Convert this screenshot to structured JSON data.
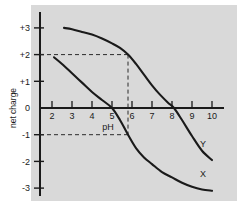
{
  "figure": {
    "background_color": "#ffffff",
    "panel_color": "#d9d9d9",
    "ink_color": "#1a1a1a"
  },
  "chart_data": {
    "type": "line",
    "title": "",
    "xlabel": "pH",
    "ylabel": "net charge",
    "xlim": [
      1.4,
      10.6
    ],
    "ylim": [
      -3.45,
      3.45
    ],
    "xticks": [
      2,
      3,
      4,
      5,
      6,
      7,
      8,
      9,
      10
    ],
    "xtick_labels": [
      "2",
      "3",
      "4",
      "5",
      "6",
      "7",
      "8",
      "9",
      "10"
    ],
    "yticks": [
      3,
      2,
      1,
      0,
      -1,
      -2,
      -3
    ],
    "ytick_labels": [
      "+3",
      "+2",
      "+1",
      "0",
      "-1",
      "-2",
      "-3"
    ],
    "grid": false,
    "legend": "inline-curve-labels",
    "series": [
      {
        "name": "Y",
        "label": "Y",
        "label_position": {
          "x": 9.55,
          "y": -1.45
        },
        "color": "#1a1a1a",
        "x": [
          2.6,
          3.0,
          3.5,
          4.0,
          4.5,
          5.0,
          5.4,
          5.8,
          6.2,
          6.6,
          7.0,
          7.4,
          7.8,
          8.1,
          8.5,
          9.0,
          9.5,
          10.0
        ],
        "y": [
          3.0,
          2.95,
          2.85,
          2.75,
          2.6,
          2.42,
          2.25,
          2.0,
          1.65,
          1.25,
          0.85,
          0.5,
          0.2,
          0.0,
          -0.45,
          -1.05,
          -1.6,
          -1.95
        ]
      },
      {
        "name": "X",
        "label": "X",
        "label_position": {
          "x": 9.55,
          "y": -2.6
        },
        "color": "#1a1a1a",
        "x": [
          2.1,
          2.5,
          3.0,
          3.5,
          4.0,
          4.5,
          5.0,
          5.4,
          5.8,
          6.2,
          6.6,
          7.0,
          7.5,
          8.0,
          8.5,
          9.0,
          9.5,
          10.0
        ],
        "y": [
          1.9,
          1.65,
          1.3,
          0.95,
          0.6,
          0.3,
          0.0,
          -0.45,
          -1.0,
          -1.5,
          -1.85,
          -2.1,
          -2.4,
          -2.6,
          -2.8,
          -2.95,
          -3.05,
          -3.1
        ]
      }
    ],
    "annotations": [
      {
        "name": "guide-horizontal-plus2",
        "type": "dashed-horizontal",
        "y": 2.0,
        "x_from": 1.4,
        "x_to": 5.8
      },
      {
        "name": "guide-horizontal-minus1",
        "type": "dashed-horizontal",
        "y": -1.0,
        "x_from": 1.4,
        "x_to": 5.8
      },
      {
        "name": "guide-vertical-ph58",
        "type": "dashed-vertical",
        "x": 5.8,
        "y_from": 2.0,
        "y_to": -1.0
      }
    ]
  }
}
